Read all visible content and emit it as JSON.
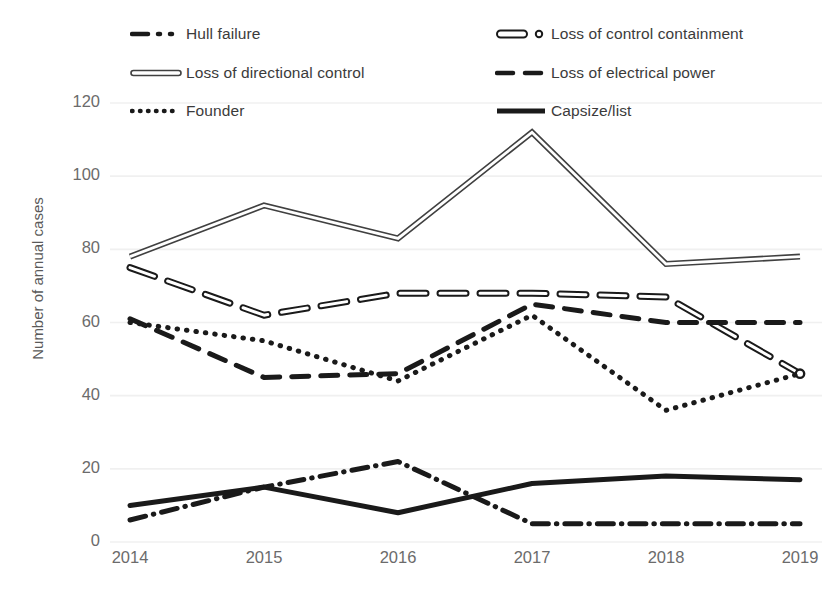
{
  "chart_data": {
    "type": "line",
    "title": "",
    "xlabel": "",
    "ylabel": "Number of annual cases",
    "categories": [
      "2014",
      "2015",
      "2016",
      "2017",
      "2018",
      "2019"
    ],
    "x": [
      2014,
      2015,
      2016,
      2017,
      2018,
      2019
    ],
    "ylim": [
      0,
      120
    ],
    "yticks": [
      0,
      20,
      40,
      60,
      80,
      100,
      120
    ],
    "grid": true,
    "legend_position": "top",
    "series": [
      {
        "name": "Hull failure",
        "style": "dash-dot",
        "color": "#1a1a1a",
        "values": [
          6,
          15,
          22,
          5,
          5,
          5
        ]
      },
      {
        "name": "Loss of control containment",
        "style": "double-line-marker",
        "color": "#1a1a1a",
        "values": [
          75,
          62,
          68,
          68,
          67,
          46
        ]
      },
      {
        "name": "Loss of directional control",
        "style": "double-line",
        "color": "#404040",
        "values": [
          78,
          92,
          83,
          112,
          76,
          78
        ]
      },
      {
        "name": "Loss of electrical power",
        "style": "dashed",
        "color": "#1a1a1a",
        "values": [
          61,
          45,
          46,
          65,
          60,
          60
        ]
      },
      {
        "name": "Founder",
        "style": "dotted",
        "color": "#1a1a1a",
        "values": [
          60,
          55,
          44,
          62,
          36,
          46
        ]
      },
      {
        "name": "Capsize/list",
        "style": "solid",
        "color": "#1a1a1a",
        "values": [
          10,
          15,
          8,
          16,
          18,
          17
        ]
      }
    ]
  },
  "legend": {
    "items": [
      {
        "label": "Hull failure",
        "icon": "dash-dot-swatch"
      },
      {
        "label": "Loss of control containment",
        "icon": "double-line-marker-swatch"
      },
      {
        "label": "Loss of directional control",
        "icon": "double-line-swatch"
      },
      {
        "label": "Loss of electrical power",
        "icon": "dashed-swatch"
      },
      {
        "label": "Founder",
        "icon": "dotted-swatch"
      },
      {
        "label": "Capsize/list",
        "icon": "solid-swatch"
      }
    ]
  },
  "axes": {
    "y_title": "Number of annual cases",
    "y_ticks": [
      "120",
      "100",
      "80",
      "60",
      "40",
      "20",
      "0"
    ],
    "x_ticks": [
      "2014",
      "2015",
      "2016",
      "2017",
      "2018",
      "2019"
    ]
  }
}
